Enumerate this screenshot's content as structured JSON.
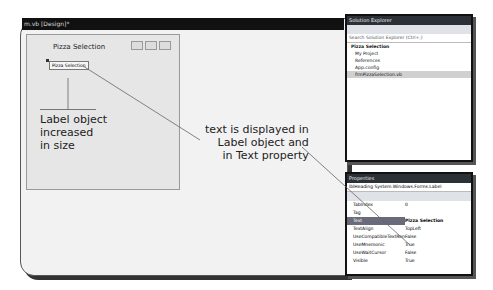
{
  "tab": {
    "title": "m.vb [Design]*"
  },
  "form": {
    "title": "Pizza Selection",
    "label_text": "Pizza Selection"
  },
  "callouts": {
    "left": [
      "Label object",
      "increased",
      "in size"
    ],
    "right": [
      "text is displayed in",
      "Label object and",
      "in Text property"
    ]
  },
  "solution_explorer": {
    "title": "Solution Explorer",
    "search_placeholder": "Search Solution Explorer (Ctrl+;)",
    "items": [
      "Pizza Selection",
      "My Project",
      "References",
      "App.config",
      "frmPizzaSelection.vb"
    ]
  },
  "properties": {
    "title": "Properties",
    "object": "lblHeading System.Windows.Forms.Label",
    "rows": [
      {
        "name": "TabIndex",
        "value": "0"
      },
      {
        "name": "Tag",
        "value": ""
      },
      {
        "name": "Text",
        "value": "Pizza Selection"
      },
      {
        "name": "TextAlign",
        "value": "TopLeft"
      },
      {
        "name": "UseCompatibleTextRen",
        "value": "False"
      },
      {
        "name": "UseMnemonic",
        "value": "True"
      },
      {
        "name": "UseWaitCursor",
        "value": "False"
      },
      {
        "name": "Visible",
        "value": "True"
      }
    ]
  }
}
